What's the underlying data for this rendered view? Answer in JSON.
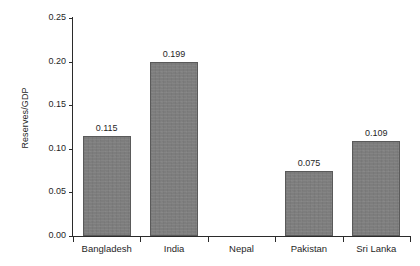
{
  "chart_data": {
    "type": "bar",
    "title": "",
    "xlabel": "",
    "ylabel": "Reserves/GDP",
    "categories": [
      "Bangladesh",
      "India",
      "Nepal",
      "Pakistan",
      "Sri Lanka"
    ],
    "values": [
      0.115,
      0.199,
      null,
      0.075,
      0.109
    ],
    "value_labels": [
      "0.115",
      "0.199",
      "",
      "0.075",
      "0.109"
    ],
    "ylim": [
      0.0,
      0.25
    ],
    "ytick_values": [
      0.0,
      0.05,
      0.1,
      0.15,
      0.2,
      0.25
    ],
    "ytick_labels": [
      "0.00",
      "0.05",
      "0.10",
      "0.15",
      "0.20",
      "0.25"
    ],
    "grid": false,
    "legend": null,
    "bar_color": "#7d7d7d",
    "bar_edge_color": "#5a5a5a",
    "axis_color": "#2b2b2b",
    "background_color": "#ffffff"
  }
}
